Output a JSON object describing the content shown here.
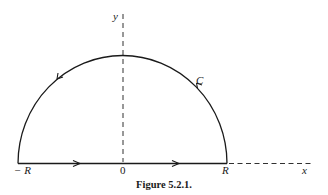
{
  "figure": {
    "caption": "Figure 5.2.1.",
    "labels": {
      "y_axis": "y",
      "x_axis": "x",
      "origin": "0",
      "neg_R": "− R",
      "pos_R": "R",
      "contour": "C"
    },
    "colors": {
      "stroke": "#1a1a1a",
      "background": "#ffffff"
    },
    "elements": {
      "contour": "semicircular contour in upper half-plane of radius R, traversed counterclockwise",
      "segment": "straight segment on real axis from -R to R with two rightward arrows",
      "arc": "semicircular arc from R back to -R with two leftward/upward arrows",
      "axes": "dashed y-axis through origin and dashed x-axis extension beyond R"
    }
  }
}
